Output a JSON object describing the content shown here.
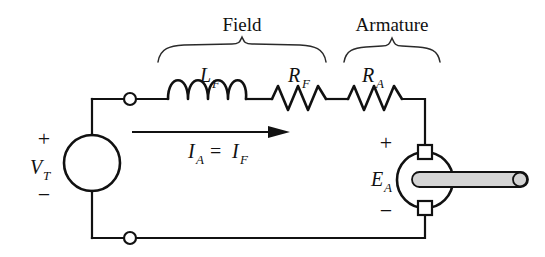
{
  "figure": {
    "type": "circuit-schematic",
    "background_color": "#ffffff",
    "line_color": "#111111",
    "shaft_color": "#d4d4d4"
  },
  "braces": {
    "field": {
      "label": "Field",
      "x_start": 158,
      "x_end": 326
    },
    "armature": {
      "label": "Armature",
      "x_start": 344,
      "x_end": 440
    }
  },
  "components": {
    "source": {
      "name": "voltage-source",
      "label": "V",
      "subscript": "T",
      "plus": "+",
      "minus": "−",
      "cx": 92,
      "cy": 163,
      "r": 28
    },
    "inductor": {
      "name": "field-inductor",
      "label": "L",
      "subscript": "F",
      "loops": 4,
      "x_start": 168,
      "x_end": 246
    },
    "field_resistor": {
      "name": "field-resistor",
      "label": "R",
      "subscript": "F",
      "x_start": 272,
      "x_end": 326
    },
    "armature_resistor": {
      "name": "armature-resistor",
      "label": "R",
      "subscript": "A",
      "x_start": 348,
      "x_end": 402
    },
    "motor": {
      "name": "motor-armature",
      "label": "E",
      "subscript": "A",
      "plus": "+",
      "minus": "−",
      "cx": 425,
      "cy": 180,
      "r": 28
    }
  },
  "current": {
    "name": "current-arrow",
    "label_left": "I",
    "label_left_sub": "A",
    "equals": "=",
    "label_right": "I",
    "label_right_sub": "F",
    "arrow_x_start": 132,
    "arrow_x_end": 290,
    "arrow_y": 132
  },
  "nodes": {
    "top_terminal": {
      "name": "top-terminal-node",
      "cx": 130,
      "cy": 99,
      "r": 6
    },
    "bottom_terminal": {
      "name": "bottom-terminal-node",
      "cx": 130,
      "cy": 238,
      "r": 6
    }
  }
}
